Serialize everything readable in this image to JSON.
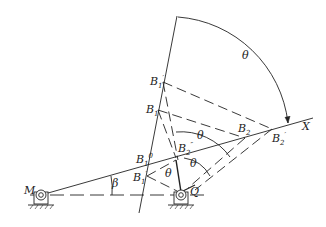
{
  "diagram": {
    "type": "kinematic-linkage",
    "labels": {
      "M": "M",
      "Q": "Q",
      "X": "X",
      "beta": "β",
      "theta_top": "θ",
      "theta_mid": "θ",
      "theta_low": "θ",
      "theta_inner": "θ",
      "B1p_top": {
        "base": "B",
        "sub": "1",
        "sup": "′"
      },
      "B1": {
        "base": "B",
        "sub": "1"
      },
      "B1o": {
        "base": "B",
        "sub": "1",
        "sup": "0"
      },
      "B1p_low": {
        "base": "B",
        "sub": "1",
        "sup": "′"
      },
      "B2": {
        "base": "B",
        "sub": "2"
      },
      "B2p": {
        "base": "B",
        "sub": "2",
        "sup": "′"
      },
      "B2pp": {
        "base": "B",
        "sub": "2",
        "sup": "″"
      }
    },
    "colors": {
      "ink": "#222222",
      "background": "#ffffff"
    }
  }
}
